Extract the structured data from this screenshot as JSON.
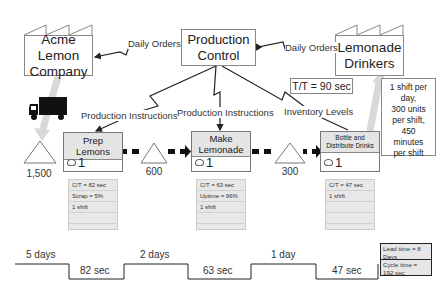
{
  "supplier": {
    "name_line1": "Acme Lemon",
    "name_line2": "Company"
  },
  "customer": {
    "name_line1": "Lemonade",
    "name_line2": "Drinkers"
  },
  "production_control": {
    "line1": "Production",
    "line2": "Control"
  },
  "flows": {
    "daily_orders_supplier": "Daily Orders",
    "daily_orders_customer": "Daily Orders",
    "production_instructions_1": "Production Instructions",
    "production_instructions_2": "Production Instructions",
    "inventory_levels": "Inventory Levels"
  },
  "takt_time": "T/T = 90 sec",
  "customer_requirements": [
    "1 shift per",
    "day,",
    "300 units",
    "per shift,",
    "450",
    "minutes",
    "per shift"
  ],
  "processes": [
    {
      "title": "Prep Lemons",
      "operators": "1",
      "data": [
        "C/T = 82 sec",
        "Scrap = 5%",
        "1 shift",
        "",
        ""
      ]
    },
    {
      "title": "Make Lemonade",
      "operators": "1",
      "data": [
        "C/T = 63 sec",
        "Uptime = 96%",
        "1 shift",
        "",
        ""
      ]
    },
    {
      "title": "Bottle and Distribute Drinks",
      "operators": "1",
      "data": [
        "C/T = 47 sec",
        "1 shift",
        "",
        "",
        ""
      ]
    }
  ],
  "inventory": [
    "1,500",
    "600",
    "300"
  ],
  "timeline": {
    "wait_times": [
      "5 days",
      "2 days",
      "1 day"
    ],
    "process_times": [
      "82 sec",
      "63 sec",
      "47 sec"
    ],
    "lead_time": "Lead time = 8 Days",
    "cycle_time": "Cycle time = 192 sec"
  }
}
